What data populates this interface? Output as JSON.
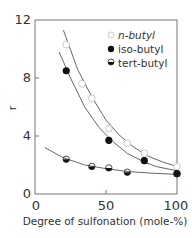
{
  "chart_data": {
    "type": "scatter",
    "title": "",
    "xlabel": "Degree of sulfonation (mole-%)",
    "ylabel": "r",
    "xlim": [
      0,
      100
    ],
    "ylim": [
      0,
      12
    ],
    "xticks": [
      0,
      50,
      100
    ],
    "yticks": [
      0,
      4,
      8,
      12
    ],
    "grid": false,
    "legend_position": "upper right",
    "series": [
      {
        "name": "n-butyl",
        "marker": "open-circle",
        "x": [
          22,
          33,
          40,
          52,
          65,
          77,
          100
        ],
        "y": [
          10.3,
          7.6,
          6.6,
          4.5,
          3.5,
          2.8,
          1.9
        ],
        "fit": [
          [
            20,
            11.3
          ],
          [
            30,
            8.6
          ],
          [
            40,
            6.7
          ],
          [
            50,
            5.1
          ],
          [
            60,
            4.0
          ],
          [
            70,
            3.2
          ],
          [
            80,
            2.6
          ],
          [
            90,
            2.2
          ],
          [
            100,
            1.9
          ]
        ]
      },
      {
        "name": "iso-butyl",
        "marker": "filled-circle",
        "x": [
          22,
          52,
          77,
          100
        ],
        "y": [
          8.5,
          3.7,
          2.3,
          1.4
        ],
        "fit": [
          [
            17,
            9.8
          ],
          [
            25,
            8.0
          ],
          [
            35,
            6.0
          ],
          [
            45,
            4.6
          ],
          [
            55,
            3.6
          ],
          [
            65,
            2.8
          ],
          [
            75,
            2.3
          ],
          [
            85,
            1.9
          ],
          [
            100,
            1.6
          ]
        ]
      },
      {
        "name": "tert-butyl",
        "marker": "half-filled-circle",
        "x": [
          22,
          40,
          52,
          65,
          100
        ],
        "y": [
          2.4,
          1.9,
          1.8,
          1.5,
          1.4
        ],
        "fit": [
          [
            7,
            3.2
          ],
          [
            20,
            2.5
          ],
          [
            35,
            2.0
          ],
          [
            50,
            1.75
          ],
          [
            65,
            1.55
          ],
          [
            80,
            1.45
          ],
          [
            100,
            1.35
          ]
        ]
      }
    ]
  },
  "labels": {
    "y_tick_0": "0",
    "y_tick_4": "4",
    "y_tick_8": "8",
    "y_tick_12": "12",
    "x_tick_0": "0",
    "x_tick_50": "50",
    "x_tick_100": "100",
    "xlabel": "Degree of sulfonation (mole-%)",
    "ylabel": "r",
    "legend": [
      "n-butyl",
      "iso-butyl",
      "tert-butyl"
    ]
  }
}
